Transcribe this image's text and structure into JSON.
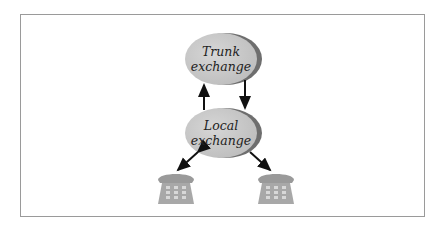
{
  "diagram": {
    "nodes": [
      {
        "id": "trunk",
        "line1": "Trunk",
        "line2": "exchange"
      },
      {
        "id": "local",
        "line1": "Local",
        "line2": "exchange"
      },
      {
        "id": "phone1",
        "label": "telephone"
      },
      {
        "id": "phone2",
        "label": "telephone"
      }
    ],
    "edges": [
      {
        "from": "local",
        "to": "trunk"
      },
      {
        "from": "trunk",
        "to": "local"
      },
      {
        "from": "local",
        "to": "phone1",
        "bidirectional": true
      },
      {
        "from": "local",
        "to": "phone2"
      }
    ],
    "colors": {
      "node_fill": "#c8c8c8",
      "node_shadow": "#6e6e6e",
      "arrow": "#111111",
      "frame": "#9a9a9a"
    }
  }
}
